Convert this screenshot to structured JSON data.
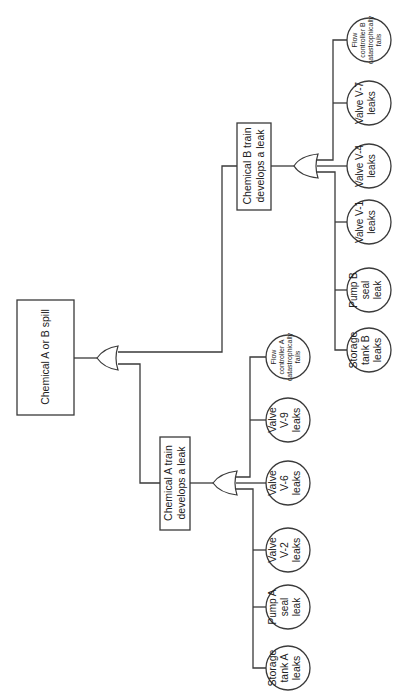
{
  "diagram": {
    "type": "fault-tree",
    "orientation": "rotated-90-ccw",
    "top_event": {
      "label": "Chemical A or B spill"
    },
    "intermediate_events": [
      {
        "id": "A",
        "label_lines": [
          "Chemical A train",
          "develops a leak"
        ]
      },
      {
        "id": "B",
        "label_lines": [
          "Chemical B train",
          "develops a leak"
        ]
      }
    ],
    "gates": [
      {
        "id": "top",
        "type": "OR"
      },
      {
        "id": "A",
        "type": "OR"
      },
      {
        "id": "B",
        "type": "OR"
      }
    ],
    "basic_events_A": [
      {
        "lines": [
          "Storage",
          "tank A",
          "leaks"
        ]
      },
      {
        "lines": [
          "Pump A",
          "seal",
          "leak"
        ]
      },
      {
        "lines": [
          "Valve",
          "V-2",
          "leaks"
        ]
      },
      {
        "lines": [
          "Valve",
          "V-6",
          "leaks"
        ]
      },
      {
        "lines": [
          "Valve",
          "V-9",
          "leaks"
        ]
      },
      {
        "lines": [
          "Flow",
          "controller A",
          "catastrophically",
          "fails"
        ]
      }
    ],
    "basic_events_B": [
      {
        "lines": [
          "Storage",
          "tank B",
          "leaks"
        ]
      },
      {
        "lines": [
          "Pump B",
          "seal",
          "leak"
        ]
      },
      {
        "lines": [
          "Valve V-1",
          "leaks"
        ]
      },
      {
        "lines": [
          "Valve V-4",
          "leaks"
        ]
      },
      {
        "lines": [
          "Valve V-7",
          "leaks"
        ]
      },
      {
        "lines": [
          "Flow",
          "controller B",
          "catastrophically",
          "fails"
        ]
      }
    ]
  }
}
